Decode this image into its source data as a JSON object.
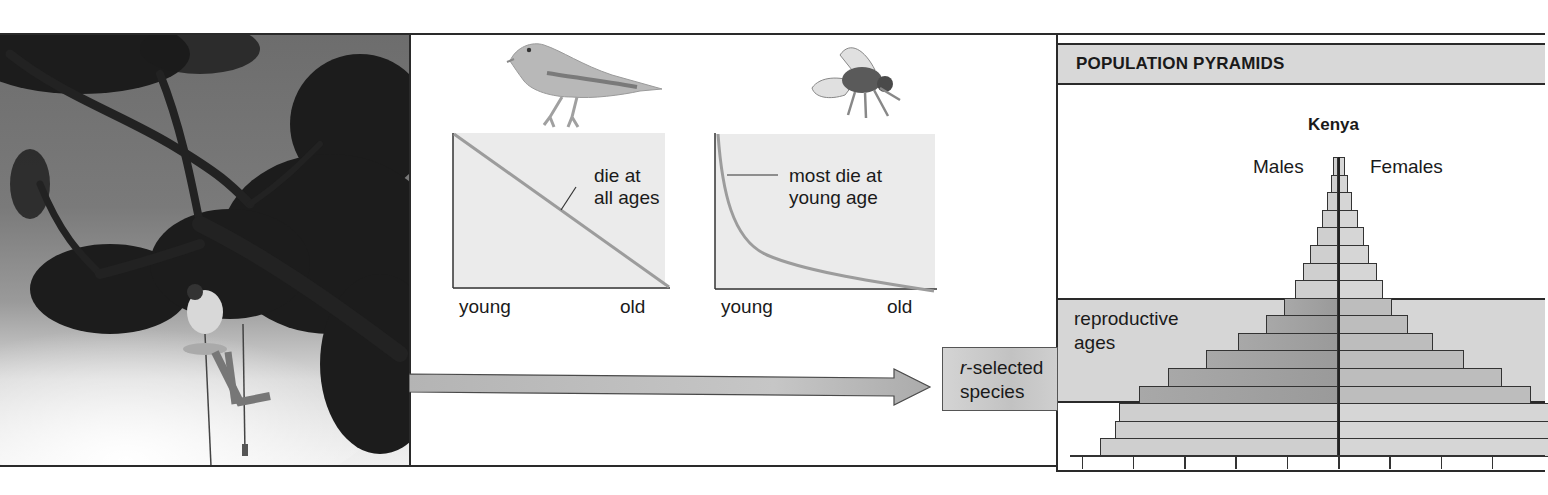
{
  "photo": {
    "description": "person suspended by ropes beneath a large moss-covered tree branch against a cloudy sky",
    "icon": "tree-climber-photo"
  },
  "survivorship": {
    "left_graph": {
      "animal_icon": "bird-icon",
      "annotation": [
        "die at",
        "all ages"
      ],
      "x_start_label": "young",
      "x_end_label": "old",
      "curve": "straight diagonal decline"
    },
    "right_graph": {
      "animal_icon": "fly-icon",
      "annotation": [
        "most die at",
        "young age"
      ],
      "x_start_label": "young",
      "x_end_label": "old",
      "curve": "steep early decline, long flat tail"
    }
  },
  "arrow": {
    "target_label_prefix": "r",
    "target_label_rest": "-selected",
    "target_label_line2": "species"
  },
  "pyramid_panel": {
    "header": "POPULATION PYRAMIDS",
    "country": "Kenya",
    "left_label": "Males",
    "right_label": "Females",
    "band_label": [
      "reproductive",
      "ages"
    ]
  },
  "chart_data": {
    "type": "bar",
    "title": "Kenya",
    "orientation": "horizontal-pyramid",
    "categories": [
      "row1 (oldest)",
      "row2",
      "row3",
      "row4",
      "row5",
      "row6",
      "row7",
      "row8",
      "row9",
      "row10",
      "row11",
      "row12",
      "row13",
      "row14",
      "row15",
      "row16",
      "row17 (youngest)"
    ],
    "series": [
      {
        "name": "Males",
        "values": [
          5,
          7,
          11,
          16,
          21,
          28,
          35,
          43,
          54,
          72,
          100,
          132,
          170,
          199,
          219,
          223,
          238
        ]
      },
      {
        "name": "Females",
        "values": [
          7,
          10,
          14,
          20,
          26,
          31,
          39,
          45,
          54,
          70,
          95,
          126,
          164,
          193,
          210,
          210,
          210
        ]
      }
    ],
    "units": "pixels from center axis (relative population size)",
    "reproductive_age_rows": [
      8,
      9,
      10,
      11,
      12,
      13
    ],
    "x_ticks": 9,
    "grid": false,
    "legend": "Males left / Females right",
    "note": "Female bars for the three youngest rows extend past the visible crop edge"
  }
}
